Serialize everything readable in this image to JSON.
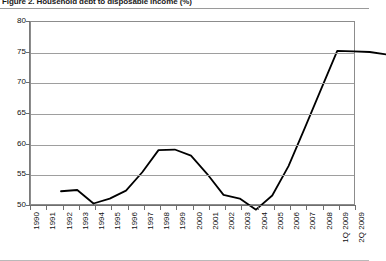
{
  "figure": {
    "title": "Figure 2. Household debt to disposable income (%)"
  },
  "chart_data": {
    "type": "line",
    "title": "Figure 2. Household debt to disposable income (%)",
    "xlabel": "",
    "ylabel": "",
    "ylim": [
      50,
      80
    ],
    "ytick_step": 5,
    "yticks": [
      50,
      55,
      60,
      65,
      70,
      75,
      80
    ],
    "grid": true,
    "legend": false,
    "line_color": "#000000",
    "categories": [
      "1990",
      "1991",
      "1992",
      "1993",
      "1994",
      "1995",
      "1996",
      "1997",
      "1998",
      "1999",
      "2000",
      "2001",
      "2002",
      "2003",
      "2004",
      "2005",
      "2006",
      "2007",
      "2008",
      "1Q 2009",
      "2Q 2009"
    ],
    "values": [
      54.2,
      54.4,
      52.2,
      53.0,
      54.3,
      57.3,
      60.9,
      61.0,
      60.0,
      57.0,
      53.6,
      53.0,
      51.2,
      53.5,
      58.3,
      64.5,
      70.8,
      77.1,
      77.0,
      76.9,
      76.5
    ]
  }
}
